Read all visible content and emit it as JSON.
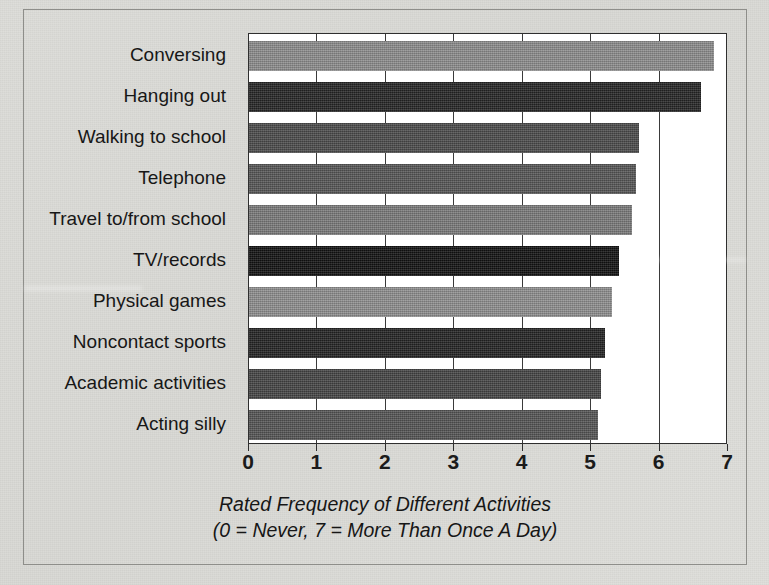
{
  "chart_data": {
    "type": "bar",
    "orientation": "horizontal",
    "title": "",
    "subtitle": "",
    "xlabel": "Rated Frequency of Different Activities",
    "xlabel_note": "(0 = Never,  7 = More Than Once A Day)",
    "ylabel": "",
    "xlim": [
      0,
      7
    ],
    "xticks": [
      0,
      1,
      2,
      3,
      4,
      5,
      6,
      7
    ],
    "xtick_labels": [
      "0",
      "1",
      "2",
      "3",
      "4",
      "5",
      "6",
      "7"
    ],
    "grid": "vertical",
    "legend": "none",
    "categories": [
      "Conversing",
      "Hanging out",
      "Walking to school",
      "Telephone",
      "Travel to/from school",
      "TV/records",
      "Physical games",
      "Noncontact sports",
      "Academic activities",
      "Acting silly"
    ],
    "values": [
      6.8,
      6.6,
      5.7,
      5.65,
      5.6,
      5.4,
      5.3,
      5.2,
      5.15,
      5.1
    ],
    "bar_colors": [
      "#8d8d8d",
      "#262626",
      "#4b4b4b",
      "#565656",
      "#7b7b7b",
      "#121212",
      "#8f8f8f",
      "#232323",
      "#454545",
      "#555555"
    ]
  },
  "caption": {
    "line1": "Rated Frequency of Different Activities",
    "line2": "(0 = Never,  7 = More Than Once A Day)"
  }
}
